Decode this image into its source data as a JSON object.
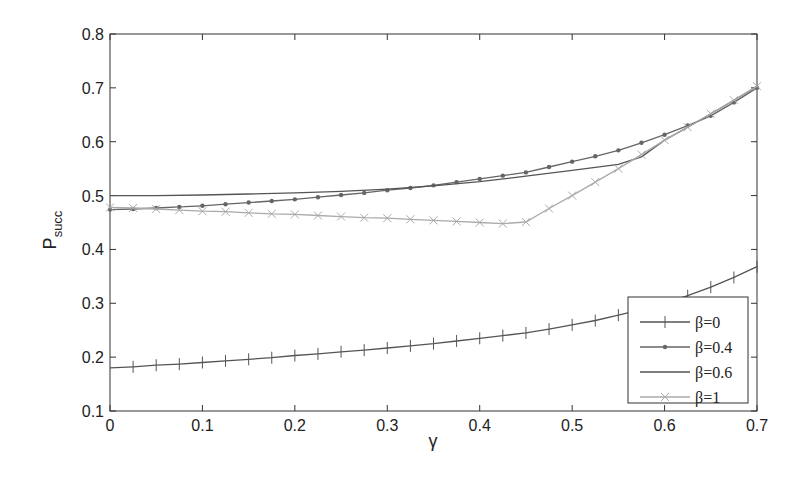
{
  "chart_data": {
    "type": "line",
    "title": "",
    "xlabel": "γ",
    "ylabel": "P",
    "ylabel_subscript": "succ",
    "xlim": [
      0,
      0.7
    ],
    "ylim": [
      0.1,
      0.8
    ],
    "grid": false,
    "legend_position": "lower right",
    "x_ticks": [
      "0",
      "0.1",
      "0.2",
      "0.3",
      "0.4",
      "0.5",
      "0.6",
      "0.7"
    ],
    "y_ticks": [
      "0.1",
      "0.2",
      "0.3",
      "0.4",
      "0.5",
      "0.6",
      "0.7",
      "0.8"
    ],
    "series": [
      {
        "name": "β=0",
        "marker": "plus",
        "color": "#555555",
        "x": [
          0,
          0.025,
          0.05,
          0.075,
          0.1,
          0.125,
          0.15,
          0.175,
          0.2,
          0.225,
          0.25,
          0.275,
          0.3,
          0.325,
          0.35,
          0.375,
          0.4,
          0.425,
          0.45,
          0.475,
          0.5,
          0.525,
          0.55,
          0.575,
          0.6,
          0.625,
          0.65,
          0.675,
          0.7
        ],
        "values": [
          0.18,
          0.182,
          0.185,
          0.187,
          0.19,
          0.193,
          0.196,
          0.199,
          0.203,
          0.206,
          0.21,
          0.213,
          0.217,
          0.221,
          0.225,
          0.23,
          0.235,
          0.24,
          0.245,
          0.252,
          0.26,
          0.268,
          0.278,
          0.288,
          0.3,
          0.314,
          0.33,
          0.348,
          0.368
        ]
      },
      {
        "name": "β=0.4",
        "marker": "dot",
        "color": "#666666",
        "x": [
          0,
          0.025,
          0.05,
          0.075,
          0.1,
          0.125,
          0.15,
          0.175,
          0.2,
          0.225,
          0.25,
          0.275,
          0.3,
          0.325,
          0.35,
          0.375,
          0.4,
          0.425,
          0.45,
          0.475,
          0.5,
          0.525,
          0.55,
          0.575,
          0.6,
          0.625,
          0.65,
          0.675,
          0.7
        ],
        "values": [
          0.474,
          0.475,
          0.477,
          0.479,
          0.481,
          0.484,
          0.487,
          0.49,
          0.493,
          0.497,
          0.501,
          0.505,
          0.51,
          0.514,
          0.519,
          0.525,
          0.531,
          0.537,
          0.543,
          0.553,
          0.563,
          0.573,
          0.584,
          0.598,
          0.613,
          0.63,
          0.648,
          0.673,
          0.7
        ]
      },
      {
        "name": "β=0.6",
        "marker": "none",
        "color": "#555555",
        "x": [
          0,
          0.05,
          0.1,
          0.15,
          0.2,
          0.25,
          0.3,
          0.35,
          0.4,
          0.45,
          0.5,
          0.55,
          0.575,
          0.6,
          0.625,
          0.65,
          0.675,
          0.7
        ],
        "values": [
          0.5,
          0.5,
          0.501,
          0.503,
          0.505,
          0.508,
          0.512,
          0.518,
          0.526,
          0.536,
          0.547,
          0.558,
          0.572,
          0.603,
          0.627,
          0.652,
          0.677,
          0.703
        ]
      },
      {
        "name": "β=1",
        "marker": "x",
        "color": "#aaaaaa",
        "x": [
          0,
          0.025,
          0.05,
          0.075,
          0.1,
          0.125,
          0.15,
          0.175,
          0.2,
          0.225,
          0.25,
          0.275,
          0.3,
          0.325,
          0.35,
          0.375,
          0.4,
          0.425,
          0.45,
          0.475,
          0.5,
          0.525,
          0.55,
          0.575,
          0.6,
          0.625,
          0.65,
          0.675,
          0.7
        ],
        "values": [
          0.478,
          0.477,
          0.475,
          0.473,
          0.471,
          0.47,
          0.468,
          0.466,
          0.465,
          0.463,
          0.461,
          0.459,
          0.458,
          0.456,
          0.454,
          0.452,
          0.45,
          0.448,
          0.451,
          0.476,
          0.5,
          0.525,
          0.55,
          0.576,
          0.603,
          0.627,
          0.652,
          0.677,
          0.703
        ]
      }
    ]
  },
  "legend": {
    "items": [
      "β=0",
      "β=0.4",
      "β=0.6",
      "β=1"
    ]
  },
  "axes": {
    "xlabel": "γ",
    "ylabel_main": "P",
    "ylabel_sub": "succ"
  }
}
